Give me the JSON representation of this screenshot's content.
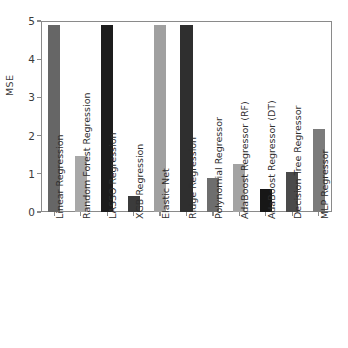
{
  "chart_data": {
    "type": "bar",
    "title": "",
    "xlabel": "",
    "ylabel": "MSE",
    "ylim": [
      0,
      5
    ],
    "yticks": [
      "0",
      "1",
      "2",
      "3",
      "4",
      "5"
    ],
    "grid": false,
    "legend": false,
    "categories": [
      "Linear Regression",
      "Random Forest Regression",
      "LASSO Regression",
      "XGB Regression",
      "Elastic Net",
      "Ridge Regression",
      "Polynomial Regressor",
      "AdaBoost Regressor (RF)",
      "AdaBoost Regressor (DT)",
      "Decision Tree Regressor",
      "MLP Regressor"
    ],
    "values": [
      4.9,
      1.47,
      4.9,
      0.42,
      4.9,
      4.9,
      0.89,
      1.27,
      0.6,
      1.05,
      2.17
    ],
    "bar_colors": [
      "#666666",
      "#a8a8a8",
      "#1c1c1c",
      "#3b3b3b",
      "#a0a0a0",
      "#2f2f2f",
      "#6e6e6e",
      "#a3a3a3",
      "#171717",
      "#4a4a4a",
      "#7b7b7b"
    ],
    "clipped_categories": [
      "Linear Regression",
      "LASSO Regression",
      "Elastic Net",
      "Ridge Regression"
    ]
  },
  "colors": {
    "axis": "#8a8a8a",
    "tick_text": "#3b3b3b",
    "label_text": "#2e2e2e",
    "background": "#ffffff"
  }
}
